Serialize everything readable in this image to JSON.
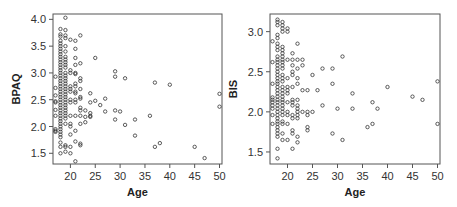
{
  "chart_data": [
    {
      "type": "scatter",
      "title": "",
      "xlabel": "Age",
      "ylabel": "BPAQ",
      "xlim": [
        16.5,
        50.5
      ],
      "ylim": [
        1.3,
        4.1
      ],
      "xticks": [
        20,
        25,
        30,
        35,
        40,
        45,
        50
      ],
      "yticks": [
        1.5,
        2.0,
        2.5,
        3.0,
        3.5,
        4.0
      ],
      "ytick_labels": [
        "1.5",
        "2.0",
        "2.5",
        "3.0",
        "3.5",
        "4.0"
      ],
      "grid": false,
      "points": [
        [
          17,
          2.93
        ],
        [
          17,
          2.72
        ],
        [
          17,
          2.58
        ],
        [
          17,
          2.47
        ],
        [
          17,
          2.45
        ],
        [
          17,
          2.31
        ],
        [
          17,
          2.2
        ],
        [
          17,
          1.95
        ],
        [
          17,
          1.92
        ],
        [
          17,
          1.9
        ],
        [
          18,
          3.82
        ],
        [
          18,
          3.72
        ],
        [
          18,
          3.68
        ],
        [
          18,
          3.6
        ],
        [
          18,
          3.55
        ],
        [
          18,
          3.5
        ],
        [
          18,
          3.45
        ],
        [
          18,
          3.4
        ],
        [
          18,
          3.35
        ],
        [
          18,
          3.3
        ],
        [
          18,
          3.25
        ],
        [
          18,
          3.2
        ],
        [
          18,
          3.15
        ],
        [
          18,
          3.1
        ],
        [
          18,
          3.05
        ],
        [
          18,
          3.0
        ],
        [
          18,
          2.95
        ],
        [
          18,
          2.9
        ],
        [
          18,
          2.85
        ],
        [
          18,
          2.8
        ],
        [
          18,
          2.75
        ],
        [
          18,
          2.7
        ],
        [
          18,
          2.65
        ],
        [
          18,
          2.6
        ],
        [
          18,
          2.55
        ],
        [
          18,
          2.5
        ],
        [
          18,
          2.45
        ],
        [
          18,
          2.4
        ],
        [
          18,
          2.35
        ],
        [
          18,
          2.3
        ],
        [
          18,
          2.25
        ],
        [
          18,
          2.2
        ],
        [
          18,
          2.15
        ],
        [
          18,
          2.1
        ],
        [
          18,
          2.05
        ],
        [
          18,
          2.0
        ],
        [
          18,
          1.95
        ],
        [
          18,
          1.9
        ],
        [
          18,
          1.85
        ],
        [
          18,
          1.8
        ],
        [
          18,
          1.7
        ],
        [
          18,
          1.62
        ],
        [
          18,
          1.5
        ],
        [
          19,
          4.03
        ],
        [
          19,
          3.8
        ],
        [
          19,
          3.7
        ],
        [
          19,
          3.65
        ],
        [
          19,
          3.5
        ],
        [
          19,
          3.4
        ],
        [
          19,
          3.3
        ],
        [
          19,
          3.25
        ],
        [
          19,
          3.2
        ],
        [
          19,
          3.15
        ],
        [
          19,
          3.1
        ],
        [
          19,
          3.0
        ],
        [
          19,
          2.95
        ],
        [
          19,
          2.9
        ],
        [
          19,
          2.85
        ],
        [
          19,
          2.8
        ],
        [
          19,
          2.75
        ],
        [
          19,
          2.7
        ],
        [
          19,
          2.65
        ],
        [
          19,
          2.6
        ],
        [
          19,
          2.55
        ],
        [
          19,
          2.5
        ],
        [
          19,
          2.45
        ],
        [
          19,
          2.4
        ],
        [
          19,
          2.35
        ],
        [
          19,
          2.3
        ],
        [
          19,
          2.25
        ],
        [
          19,
          2.2
        ],
        [
          19,
          2.15
        ],
        [
          19,
          2.05
        ],
        [
          19,
          1.65
        ],
        [
          19,
          1.62
        ],
        [
          19,
          1.53
        ],
        [
          20,
          3.62
        ],
        [
          20,
          3.05
        ],
        [
          20,
          3.0
        ],
        [
          20,
          2.75
        ],
        [
          20,
          2.7
        ],
        [
          20,
          2.65
        ],
        [
          20,
          2.5
        ],
        [
          20,
          2.45
        ],
        [
          20,
          2.2
        ],
        [
          20,
          2.05
        ],
        [
          20,
          2.0
        ],
        [
          20,
          1.85
        ],
        [
          20,
          1.62
        ],
        [
          20,
          1.5
        ],
        [
          21,
          3.6
        ],
        [
          21,
          3.45
        ],
        [
          21,
          3.28
        ],
        [
          21,
          3.15
        ],
        [
          21,
          3.0
        ],
        [
          21,
          2.98
        ],
        [
          21,
          2.8
        ],
        [
          21,
          2.75
        ],
        [
          21,
          2.65
        ],
        [
          21,
          2.62
        ],
        [
          21,
          2.5
        ],
        [
          21,
          2.45
        ],
        [
          21,
          2.2
        ],
        [
          21,
          1.92
        ],
        [
          21,
          1.72
        ],
        [
          21,
          1.35
        ],
        [
          22,
          3.7
        ],
        [
          22,
          3.18
        ],
        [
          22,
          2.9
        ],
        [
          22,
          2.85
        ],
        [
          22,
          2.7
        ],
        [
          22,
          2.55
        ],
        [
          22,
          2.52
        ],
        [
          22,
          2.35
        ],
        [
          22,
          2.3
        ],
        [
          22,
          2.2
        ],
        [
          22,
          2.05
        ],
        [
          22,
          1.68
        ],
        [
          22,
          1.65
        ],
        [
          23,
          2.3
        ],
        [
          23,
          2.18
        ],
        [
          23,
          2.08
        ],
        [
          24,
          2.62
        ],
        [
          24,
          2.45
        ],
        [
          24,
          2.25
        ],
        [
          24,
          2.2
        ],
        [
          24,
          2.18
        ],
        [
          25,
          3.28
        ],
        [
          25,
          2.48
        ],
        [
          26,
          2.4
        ],
        [
          27,
          2.52
        ],
        [
          27,
          2.28
        ],
        [
          29,
          3.03
        ],
        [
          29,
          2.93
        ],
        [
          29,
          2.3
        ],
        [
          29,
          2.13
        ],
        [
          30,
          2.28
        ],
        [
          31,
          2.9
        ],
        [
          31,
          2.03
        ],
        [
          33,
          2.13
        ],
        [
          33,
          1.83
        ],
        [
          36,
          2.2
        ],
        [
          37,
          2.82
        ],
        [
          37,
          1.62
        ],
        [
          38,
          1.69
        ],
        [
          40,
          2.78
        ],
        [
          45,
          1.62
        ],
        [
          47,
          1.41
        ],
        [
          50,
          2.61
        ],
        [
          50,
          2.37
        ]
      ]
    },
    {
      "type": "scatter",
      "title": "",
      "xlabel": "Age",
      "ylabel": "BIS",
      "xlim": [
        16.5,
        50.5
      ],
      "ylim": [
        1.35,
        3.22
      ],
      "xticks": [
        20,
        25,
        30,
        35,
        40,
        45,
        50
      ],
      "yticks": [
        1.5,
        2.0,
        2.5,
        3.0
      ],
      "ytick_labels": [
        "1.5",
        "2.0",
        "2.5",
        "3.0"
      ],
      "grid": false,
      "points": [
        [
          17,
          2.88
        ],
        [
          17,
          2.62
        ],
        [
          17,
          2.35
        ],
        [
          17,
          2.18
        ],
        [
          17,
          2.15
        ],
        [
          17,
          2.12
        ],
        [
          17,
          2.08
        ],
        [
          17,
          2.04
        ],
        [
          17,
          1.96
        ],
        [
          17,
          1.85
        ],
        [
          18,
          3.15
        ],
        [
          18,
          3.12
        ],
        [
          18,
          3.08
        ],
        [
          18,
          2.96
        ],
        [
          18,
          2.92
        ],
        [
          18,
          2.85
        ],
        [
          18,
          2.81
        ],
        [
          18,
          2.77
        ],
        [
          18,
          2.69
        ],
        [
          18,
          2.65
        ],
        [
          18,
          2.62
        ],
        [
          18,
          2.58
        ],
        [
          18,
          2.54
        ],
        [
          18,
          2.5
        ],
        [
          18,
          2.46
        ],
        [
          18,
          2.42
        ],
        [
          18,
          2.38
        ],
        [
          18,
          2.35
        ],
        [
          18,
          2.31
        ],
        [
          18,
          2.27
        ],
        [
          18,
          2.23
        ],
        [
          18,
          2.19
        ],
        [
          18,
          2.15
        ],
        [
          18,
          2.12
        ],
        [
          18,
          2.08
        ],
        [
          18,
          2.04
        ],
        [
          18,
          2.0
        ],
        [
          18,
          1.96
        ],
        [
          18,
          1.92
        ],
        [
          18,
          1.88
        ],
        [
          18,
          1.85
        ],
        [
          18,
          1.81
        ],
        [
          18,
          1.77
        ],
        [
          18,
          1.73
        ],
        [
          18,
          1.69
        ],
        [
          18,
          1.54
        ],
        [
          18,
          1.42
        ],
        [
          19,
          3.12
        ],
        [
          19,
          3.08
        ],
        [
          19,
          3.04
        ],
        [
          19,
          3.0
        ],
        [
          19,
          2.81
        ],
        [
          19,
          2.77
        ],
        [
          19,
          2.73
        ],
        [
          19,
          2.69
        ],
        [
          19,
          2.65
        ],
        [
          19,
          2.62
        ],
        [
          19,
          2.58
        ],
        [
          19,
          2.54
        ],
        [
          19,
          2.46
        ],
        [
          19,
          2.42
        ],
        [
          19,
          2.38
        ],
        [
          19,
          2.31
        ],
        [
          19,
          2.27
        ],
        [
          19,
          2.23
        ],
        [
          19,
          2.19
        ],
        [
          19,
          2.15
        ],
        [
          19,
          2.12
        ],
        [
          19,
          2.08
        ],
        [
          19,
          2.04
        ],
        [
          19,
          2.0
        ],
        [
          19,
          1.96
        ],
        [
          19,
          1.88
        ],
        [
          19,
          1.85
        ],
        [
          19,
          1.73
        ],
        [
          19,
          1.65
        ],
        [
          20,
          3.04
        ],
        [
          20,
          3.0
        ],
        [
          20,
          2.65
        ],
        [
          20,
          2.42
        ],
        [
          20,
          2.31
        ],
        [
          20,
          2.27
        ],
        [
          20,
          2.23
        ],
        [
          20,
          2.12
        ],
        [
          20,
          2.0
        ],
        [
          20,
          1.96
        ],
        [
          20,
          1.85
        ],
        [
          20,
          1.65
        ],
        [
          21,
          2.73
        ],
        [
          21,
          2.65
        ],
        [
          21,
          2.58
        ],
        [
          21,
          2.5
        ],
        [
          21,
          2.46
        ],
        [
          21,
          2.31
        ],
        [
          21,
          2.15
        ],
        [
          21,
          2.12
        ],
        [
          21,
          2.08
        ],
        [
          21,
          1.96
        ],
        [
          21,
          1.92
        ],
        [
          21,
          1.77
        ],
        [
          21,
          1.73
        ],
        [
          21,
          1.54
        ],
        [
          22,
          2.85
        ],
        [
          22,
          2.65
        ],
        [
          22,
          2.54
        ],
        [
          22,
          2.42
        ],
        [
          22,
          2.35
        ],
        [
          22,
          2.15
        ],
        [
          22,
          2.08
        ],
        [
          22,
          2.04
        ],
        [
          22,
          2.0
        ],
        [
          22,
          1.96
        ],
        [
          22,
          1.92
        ],
        [
          22,
          1.69
        ],
        [
          22,
          1.62
        ],
        [
          23,
          2.65
        ],
        [
          23,
          2.58
        ],
        [
          23,
          2.27
        ],
        [
          23,
          2.0
        ],
        [
          24,
          2.27
        ],
        [
          24,
          2.0
        ],
        [
          24,
          1.96
        ],
        [
          24,
          1.81
        ],
        [
          24,
          1.77
        ],
        [
          25,
          2.46
        ],
        [
          25,
          2.0
        ],
        [
          26,
          2.27
        ],
        [
          27,
          2.54
        ],
        [
          27,
          2.08
        ],
        [
          29,
          2.54
        ],
        [
          29,
          2.35
        ],
        [
          29,
          1.73
        ],
        [
          30,
          2.04
        ],
        [
          31,
          2.69
        ],
        [
          31,
          1.65
        ],
        [
          33,
          2.23
        ],
        [
          33,
          2.04
        ],
        [
          36,
          1.81
        ],
        [
          37,
          2.12
        ],
        [
          37,
          1.85
        ],
        [
          38,
          2.04
        ],
        [
          40,
          2.31
        ],
        [
          45,
          2.19
        ],
        [
          47,
          2.15
        ],
        [
          50,
          2.38
        ],
        [
          50,
          1.85
        ]
      ]
    }
  ],
  "panels": [
    {
      "frame": {
        "x0": 53,
        "y0": 14,
        "x1": 222,
        "y1": 164
      },
      "xlabel": "Age",
      "ylabel": "BPAQ"
    },
    {
      "frame": {
        "x0": 270,
        "y0": 14,
        "x1": 440,
        "y1": 164
      },
      "xlabel": "Age",
      "ylabel": "BIS"
    }
  ],
  "colors": {
    "frame": "#555555",
    "marker": "#333333",
    "text": "#222222"
  }
}
